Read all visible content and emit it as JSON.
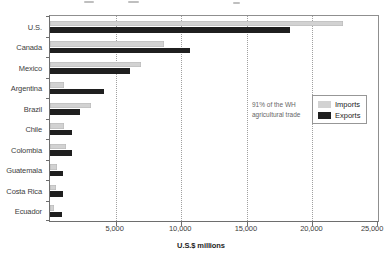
{
  "figure": {
    "axis_title": "U.S.$ millions",
    "annotation": {
      "line1": "91% of the WH",
      "line2": "agricultural trade"
    },
    "legend": {
      "items": [
        {
          "label": "Imports",
          "color": "#d2d2d2"
        },
        {
          "label": "Exports",
          "color": "#1f1f1f"
        }
      ]
    }
  },
  "chart_data": {
    "type": "bar",
    "orientation": "horizontal",
    "title": "",
    "xlabel": "U.S.$ millions",
    "ylabel": "",
    "xlim": [
      0,
      25000
    ],
    "xticks": [
      5000,
      10000,
      15000,
      20000,
      25000
    ],
    "xtick_labels": [
      "5,000",
      "10,000",
      "15,000",
      "20,000",
      "25,000"
    ],
    "grid": "vertical-dotted",
    "legend_position": "middle-right",
    "annotation": "91% of the WH agricultural trade",
    "categories": [
      "U.S.",
      "Canada",
      "Mexico",
      "Argentina",
      "Brazil",
      "Chile",
      "Colombia",
      "Guatemala",
      "Costa Rica",
      "Ecuador"
    ],
    "series": [
      {
        "name": "Imports",
        "color": "#d2d2d2",
        "values": [
          22300,
          8700,
          6900,
          1100,
          3100,
          1100,
          1200,
          500,
          450,
          300
        ]
      },
      {
        "name": "Exports",
        "color": "#1f1f1f",
        "values": [
          18300,
          10700,
          6100,
          4100,
          2300,
          1700,
          1700,
          1000,
          1000,
          900
        ]
      }
    ]
  }
}
